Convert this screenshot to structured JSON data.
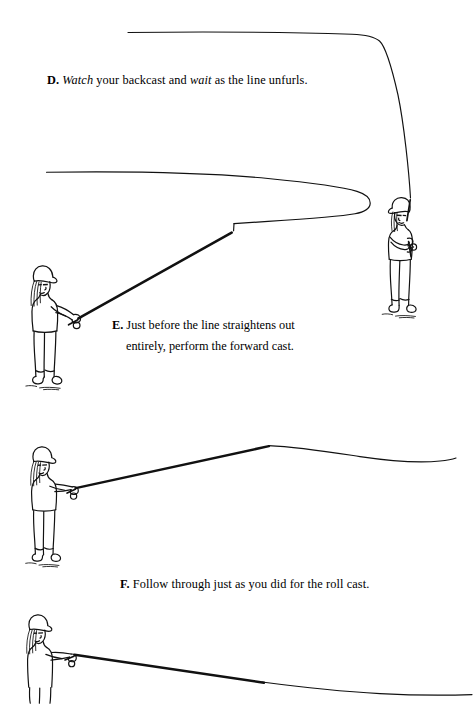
{
  "page": {
    "background_color": "#ffffff",
    "ink_color": "#000000",
    "width": 474,
    "height": 708
  },
  "captions": [
    {
      "id": "d",
      "label": "D.",
      "text_parts": [
        {
          "text": "Watch",
          "italic": true
        },
        {
          "text": " your backcast and ",
          "italic": false
        },
        {
          "text": "wait",
          "italic": true
        },
        {
          "text": " as the line unfurls.",
          "italic": false
        }
      ],
      "full_text": "D. Watch your backcast and wait as the line unfurls."
    },
    {
      "id": "e",
      "label": "E.",
      "full_text": "E. Just before the line straightens out entirely, perform the forward cast.",
      "lines": [
        "Just before the line",
        "straightens out",
        "entirely, perform",
        "the forward cast."
      ]
    },
    {
      "id": "f",
      "label": "F.",
      "full_text": "F. Follow through just as you did for the roll cast."
    }
  ],
  "figures": [
    {
      "id": "figure-d-angler",
      "name": "angler-backcast",
      "description": "Angler facing left with cap and ponytail, fly rod held vertically overhead during backcast",
      "pose": "rod-vertical",
      "facing": "left"
    },
    {
      "id": "figure-e-angler",
      "name": "angler-forward-cast-start",
      "description": "Angler facing right with cap and ponytail, rod angled up and forward as the loop unfurls",
      "pose": "rod-angled-up",
      "facing": "right"
    },
    {
      "id": "figure-f-angler",
      "name": "angler-forward-cast-mid",
      "description": "Angler facing right with cap and ponytail, rod driving forward with line straightening",
      "pose": "rod-forward",
      "facing": "right"
    },
    {
      "id": "figure-follow-through-angler",
      "name": "angler-follow-through",
      "description": "Angler facing right with cap and ponytail, rod lowered following through, cropped by page edge",
      "pose": "rod-lowered",
      "facing": "right"
    }
  ],
  "fly_lines": [
    {
      "id": "line-backcast",
      "name": "backcast-line",
      "description": "Line extending back and to the left from the vertical rod tip, running nearly level across the top of the page"
    },
    {
      "id": "line-unfurling-loop",
      "name": "unfurling-loop-line",
      "description": "Long unfurling loop: line leaves rod tip, travels right, turns over in a narrow hairpin and runs back to the left"
    },
    {
      "id": "line-forward-cast",
      "name": "forward-cast-line",
      "description": "Line shooting forward to the right from the rod tip with a gentle sag"
    },
    {
      "id": "line-follow-through",
      "name": "follow-through-line",
      "description": "Line laid out low to the right as the rod follows through"
    }
  ]
}
